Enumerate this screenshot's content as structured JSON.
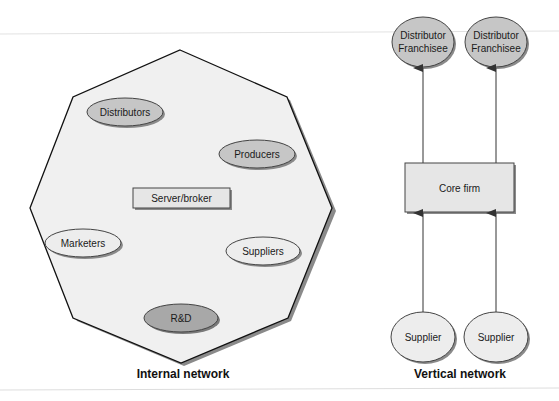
{
  "colors": {
    "background": "#ffffff",
    "octagon_fill": "#f0f0f0",
    "stroke": "#111111",
    "shadow": "#8a8a8a",
    "ellipse_dark": "#a8a8a8",
    "ellipse_medium": "#c6c6c6",
    "ellipse_light": "#ededed",
    "box_fill": "#e6e6e6"
  },
  "internal_network": {
    "caption": "Internal network",
    "center": {
      "label": "Server/broker"
    },
    "nodes": [
      {
        "label": "Distributors",
        "shade": "medium"
      },
      {
        "label": "Producers",
        "shade": "medium"
      },
      {
        "label": "Marketers",
        "shade": "light"
      },
      {
        "label": "Suppliers",
        "shade": "light"
      },
      {
        "label": "R&D",
        "shade": "dark"
      }
    ]
  },
  "vertical_network": {
    "caption": "Vertical network",
    "core": {
      "label": "Core firm"
    },
    "downstream": [
      {
        "line1": "Distributor",
        "line2": "Franchisee"
      },
      {
        "line1": "Distributor",
        "line2": "Franchisee"
      }
    ],
    "upstream": [
      {
        "label": "Supplier"
      },
      {
        "label": "Supplier"
      }
    ]
  }
}
